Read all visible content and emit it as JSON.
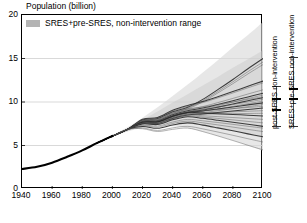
{
  "chart_data": {
    "type": "line",
    "title": "",
    "ylabel": "Population (billion)",
    "xlabel": "",
    "xlim": [
      1940,
      2100
    ],
    "ylim": [
      0,
      20
    ],
    "xticks": [
      1940,
      1960,
      1980,
      2000,
      2020,
      2040,
      2060,
      2080,
      2100
    ],
    "yticks": [
      0,
      5,
      10,
      15,
      20
    ],
    "grid": "horizontal",
    "legend": {
      "position": "top-left",
      "entries": [
        {
          "label": "SRES+pre-SRES, non-intervention range",
          "color": "#b4b4b4",
          "swatch": "band"
        }
      ]
    },
    "band": {
      "name": "SRES+pre-SRES, non-intervention range",
      "color": "#d8d8d8",
      "x": [
        1990,
        2000,
        2010,
        2020,
        2030,
        2040,
        2050,
        2060,
        2070,
        2080,
        2090,
        2100
      ],
      "upper": [
        5.3,
        6.2,
        7.1,
        8.2,
        9.4,
        10.7,
        12.0,
        13.4,
        14.8,
        16.3,
        17.7,
        19.2
      ],
      "lower": [
        5.3,
        6.0,
        6.6,
        7.0,
        7.2,
        7.2,
        7.0,
        6.6,
        6.1,
        5.6,
        5.0,
        4.4
      ]
    },
    "historical": {
      "name": "historical population",
      "color": "#000000",
      "x": [
        1940,
        1950,
        1960,
        1970,
        1980,
        1990,
        2000
      ],
      "y": [
        2.3,
        2.55,
        3.03,
        3.7,
        4.44,
        5.3,
        6.1
      ]
    },
    "series": [
      {
        "name": "scenario-01",
        "values_2050": 9.4,
        "values_2100": 15.0
      },
      {
        "name": "scenario-02",
        "values_2050": 9.3,
        "values_2100": 14.6
      },
      {
        "name": "scenario-03",
        "values_2050": 9.2,
        "values_2100": 14.3
      },
      {
        "name": "scenario-04",
        "values_2050": 9.6,
        "values_2100": 12.4
      },
      {
        "name": "scenario-05",
        "values_2050": 9.5,
        "values_2100": 12.2
      },
      {
        "name": "scenario-06",
        "values_2050": 9.1,
        "values_2100": 11.4
      },
      {
        "name": "scenario-07",
        "values_2050": 9.0,
        "values_2100": 11.0
      },
      {
        "name": "scenario-08",
        "values_2050": 8.9,
        "values_2100": 10.8
      },
      {
        "name": "scenario-09",
        "values_2050": 9.2,
        "values_2100": 10.6
      },
      {
        "name": "scenario-10",
        "values_2050": 8.8,
        "values_2100": 10.5
      },
      {
        "name": "scenario-11",
        "values_2050": 8.9,
        "values_2100": 10.3
      },
      {
        "name": "scenario-12",
        "values_2050": 8.7,
        "values_2100": 10.1
      },
      {
        "name": "scenario-13",
        "values_2050": 8.8,
        "values_2100": 9.9
      },
      {
        "name": "scenario-14",
        "values_2050": 8.6,
        "values_2100": 9.7
      },
      {
        "name": "scenario-15",
        "values_2050": 8.9,
        "values_2100": 9.5
      },
      {
        "name": "scenario-16",
        "values_2050": 8.5,
        "values_2100": 9.3
      },
      {
        "name": "scenario-17",
        "values_2050": 8.7,
        "values_2100": 9.0
      },
      {
        "name": "scenario-18",
        "values_2050": 8.6,
        "values_2100": 8.7
      },
      {
        "name": "scenario-19",
        "values_2050": 8.8,
        "values_2100": 8.4
      },
      {
        "name": "scenario-20",
        "values_2050": 8.5,
        "values_2100": 8.0
      },
      {
        "name": "scenario-21",
        "values_2050": 8.4,
        "values_2100": 7.6
      },
      {
        "name": "scenario-22",
        "values_2050": 8.3,
        "values_2100": 7.2
      },
      {
        "name": "scenario-23",
        "values_2050": 8.0,
        "values_2100": 7.0
      },
      {
        "name": "scenario-24",
        "values_2050": 7.8,
        "values_2100": 6.6
      },
      {
        "name": "scenario-25",
        "values_2050": 7.6,
        "values_2100": 6.0
      },
      {
        "name": "scenario-26",
        "values_2050": 7.2,
        "values_2100": 5.4
      },
      {
        "name": "scenario-27",
        "values_2050": 7.0,
        "values_2100": 4.5
      }
    ],
    "range_bars": [
      {
        "id": "post-sres",
        "label": "post-SRES non-intervention",
        "low": 7.0,
        "high": 11.7,
        "markers": [
          9.1,
          10.4
        ]
      },
      {
        "id": "sres-pre-sres",
        "label": "SRES+pre-SRES non-intervention",
        "low": 7.0,
        "high": 15.1,
        "markers": [
          10.4,
          11.5
        ]
      }
    ]
  }
}
